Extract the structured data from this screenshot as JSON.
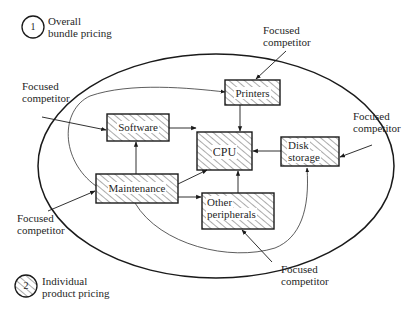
{
  "legend": {
    "overall": {
      "number": "1",
      "line1": "Overall",
      "line2": "bundle pricing"
    },
    "individual": {
      "number": "2",
      "line1": "Individual",
      "line2": "product pricing"
    }
  },
  "nodes": {
    "printers": {
      "label": "Printers"
    },
    "software": {
      "label": "Software"
    },
    "cpu": {
      "label": "CPU"
    },
    "disk": {
      "line1": "Disk",
      "line2": "storage"
    },
    "maintenance": {
      "label": "Maintenance"
    },
    "peripherals": {
      "line1": "Other",
      "line2": "peripherals"
    }
  },
  "competitors": {
    "top": {
      "line1": "Focused",
      "line2": "competitor"
    },
    "left_upper": {
      "line1": "Focused",
      "line2": "competitor"
    },
    "right": {
      "line1": "Focused",
      "line2": "competitor"
    },
    "left_lower": {
      "line1": "Focused",
      "line2": "competitor"
    },
    "bottom": {
      "line1": "Focused",
      "line2": "competitor"
    }
  },
  "colors": {
    "line": "#1a1a1a",
    "hatch": "#333333",
    "background": "#ffffff"
  }
}
